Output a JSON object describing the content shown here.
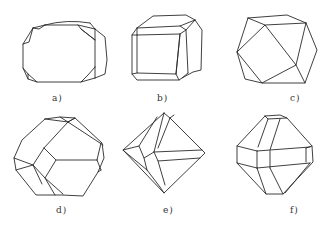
{
  "figure": {
    "panels": [
      {
        "id": "a",
        "label": "a)",
        "description": "cube with small octahedral corner truncations"
      },
      {
        "id": "b",
        "label": "b)",
        "description": "cube with dodecahedral edge bevels"
      },
      {
        "id": "c",
        "label": "c)",
        "description": "cuboctahedron"
      },
      {
        "id": "d",
        "label": "d)",
        "description": "truncated octahedron"
      },
      {
        "id": "e",
        "label": "e)",
        "description": "octahedron with re-entrant grooves"
      },
      {
        "id": "f",
        "label": "f)",
        "description": "octahedron with prism-like band"
      }
    ]
  }
}
